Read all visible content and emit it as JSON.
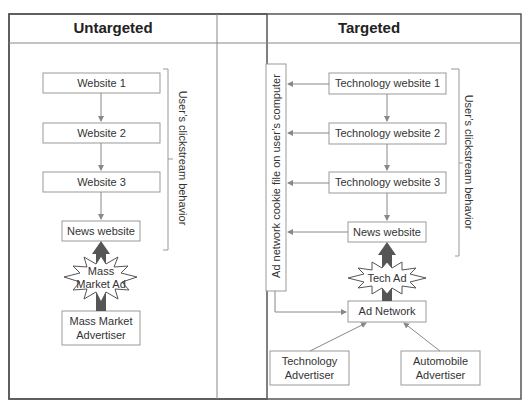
{
  "panels": {
    "untargeted": {
      "title": "Untargeted",
      "websites": [
        "Website 1",
        "Website 2",
        "Website 3"
      ],
      "news": "News website",
      "ad": "Mass\nMarket Ad",
      "ad_line1": "Mass",
      "ad_line2": "Market Ad",
      "advertiser_line1": "Mass Market",
      "advertiser_line2": "Advertiser",
      "clickstream": "User’s clickstream behavior"
    },
    "targeted": {
      "title": "Targeted",
      "websites": [
        "Technology website 1",
        "Technology website 2",
        "Technology website 3"
      ],
      "news": "News website",
      "cookie": "Ad network cookie file on user’s computer",
      "ad": "Tech Ad",
      "ad_network": "Ad Network",
      "advertisers": [
        {
          "line1": "Technology",
          "line2": "Advertiser"
        },
        {
          "line1": "Automobile",
          "line2": "Advertiser"
        }
      ],
      "clickstream": "User’s clickstream behavior"
    }
  },
  "colors": {
    "border": "#555555",
    "box": "#888888",
    "arrow": "#888888",
    "thick_arrow": "#555555"
  }
}
